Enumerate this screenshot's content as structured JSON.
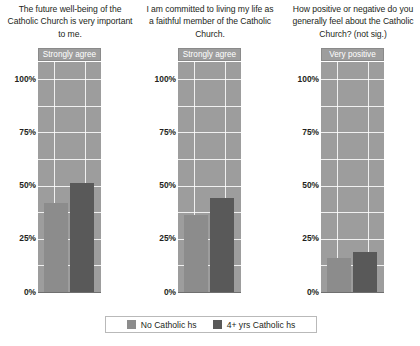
{
  "chart_data": {
    "type": "bar",
    "title": "",
    "panels": [
      {
        "title": "The future well-being of the Catholic Church is very important to me.",
        "strip_label": "Strongly agree",
        "categories": [
          "No Catholic hs",
          "4+ yrs Catholic hs"
        ],
        "values": [
          42,
          51
        ]
      },
      {
        "title": "I am committed to living my life as a faithful member of the Catholic Church.",
        "strip_label": "Strongly agree",
        "categories": [
          "No Catholic hs",
          "4+ yrs Catholic hs"
        ],
        "values": [
          36,
          44
        ]
      },
      {
        "title": "How positive or negative do you generally feel about the Catholic Church? (not sig.)",
        "strip_label": "Very positive",
        "categories": [
          "No Catholic hs",
          "4+ yrs Catholic hs"
        ],
        "values": [
          16,
          19
        ]
      }
    ],
    "ylabel": "",
    "xlabel": "",
    "ylim": [
      0,
      108
    ],
    "yticks": [
      0,
      25,
      50,
      75,
      100
    ],
    "ytick_labels": [
      "0%",
      "25%",
      "50%",
      "75%",
      "100%"
    ],
    "grid": true,
    "legend": {
      "position": "bottom",
      "entries": [
        {
          "label": "No Catholic hs",
          "color": "#8c8c8c"
        },
        {
          "label": "4+ yrs Catholic hs",
          "color": "#595959"
        }
      ]
    },
    "colors": {
      "panel_background": "#9d9d9d",
      "gridline": "#ffffff",
      "series_light": "#8c8c8c",
      "series_dark": "#595959",
      "text": "#231f20"
    }
  }
}
